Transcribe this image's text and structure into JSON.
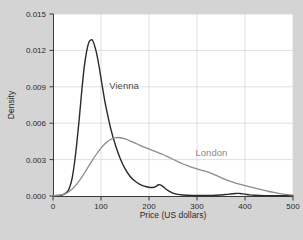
{
  "figure": {
    "background_color": "#d4d4d4",
    "plot_background_color": "#ffffff",
    "grid_color": "#d8d8d8",
    "axis_color": "#3a3a3a"
  },
  "chart_data": {
    "type": "line",
    "title": "",
    "subtitle": "",
    "xlabel": "Price (US dollars)",
    "ylabel": "Density",
    "xlim": [
      0,
      500
    ],
    "ylim": [
      0,
      0.015
    ],
    "xticks": [
      0,
      100,
      200,
      300,
      400,
      500
    ],
    "xtick_labels": [
      "0",
      "100",
      "200",
      "300",
      "400",
      "500"
    ],
    "yticks": [
      0.0,
      0.003,
      0.006,
      0.009,
      0.012,
      0.015
    ],
    "ytick_labels": [
      "0.000",
      "0.003",
      "0.006",
      "0.009",
      "0.012",
      "0.015"
    ],
    "grid": true,
    "legend": "inline-annotations",
    "annotations": [
      {
        "text": "Vienna",
        "x": 148,
        "y": 0.0088,
        "color": "#4a4a4a"
      },
      {
        "text": "London",
        "x": 330,
        "y": 0.0033,
        "color": "#8a8a8a"
      }
    ],
    "series": [
      {
        "name": "Vienna",
        "color": "#2a2a2a",
        "line_width": 1.4,
        "x": [
          0,
          10,
          20,
          30,
          35,
          40,
          45,
          50,
          55,
          60,
          65,
          70,
          75,
          80,
          82,
          85,
          90,
          95,
          100,
          105,
          110,
          120,
          130,
          140,
          150,
          160,
          170,
          180,
          190,
          200,
          205,
          210,
          215,
          220,
          225,
          230,
          235,
          240,
          250,
          260,
          270,
          280,
          300,
          320,
          340,
          360,
          370,
          380,
          385,
          390,
          400,
          410,
          420,
          440,
          460,
          480,
          500
        ],
        "y": [
          2e-05,
          4e-05,
          0.0001,
          0.00035,
          0.00075,
          0.0015,
          0.0028,
          0.0045,
          0.0065,
          0.0087,
          0.0106,
          0.0119,
          0.0127,
          0.01288,
          0.01285,
          0.0126,
          0.0119,
          0.0109,
          0.0097,
          0.0085,
          0.0074,
          0.0056,
          0.0042,
          0.0031,
          0.00225,
          0.00165,
          0.00125,
          0.00098,
          0.00082,
          0.00072,
          0.0007,
          0.00072,
          0.0008,
          0.00093,
          0.0009,
          0.00075,
          0.00058,
          0.00044,
          0.00024,
          0.00013,
          8e-05,
          6e-05,
          4e-05,
          4e-05,
          6e-05,
          0.00012,
          0.00017,
          0.00021,
          0.00022,
          0.00021,
          0.00015,
          9e-05,
          6e-05,
          3e-05,
          2e-05,
          2e-05,
          2e-05
        ]
      },
      {
        "name": "London",
        "color": "#8c8c8c",
        "line_width": 1.3,
        "x": [
          0,
          10,
          20,
          30,
          40,
          50,
          60,
          70,
          80,
          90,
          100,
          110,
          120,
          130,
          135,
          140,
          150,
          160,
          170,
          180,
          190,
          200,
          210,
          220,
          230,
          240,
          250,
          260,
          270,
          280,
          290,
          300,
          310,
          320,
          330,
          340,
          350,
          360,
          370,
          380,
          390,
          400,
          410,
          420,
          430,
          440,
          450,
          460,
          470,
          480,
          490,
          500
        ],
        "y": [
          2e-05,
          5e-05,
          0.00012,
          0.00028,
          0.00058,
          0.001,
          0.00155,
          0.00218,
          0.00282,
          0.00342,
          0.00395,
          0.00437,
          0.00466,
          0.0048,
          0.00482,
          0.0048,
          0.0047,
          0.00455,
          0.00438,
          0.0042,
          0.00403,
          0.00388,
          0.00372,
          0.00356,
          0.0034,
          0.00322,
          0.00303,
          0.00284,
          0.00266,
          0.0025,
          0.00236,
          0.00224,
          0.00212,
          0.002,
          0.00186,
          0.0017,
          0.00152,
          0.00135,
          0.0012,
          0.00107,
          0.00096,
          0.00086,
          0.00076,
          0.00066,
          0.00056,
          0.00046,
          0.00037,
          0.00029,
          0.00022,
          0.00016,
          0.00011,
          7e-05
        ]
      }
    ]
  }
}
